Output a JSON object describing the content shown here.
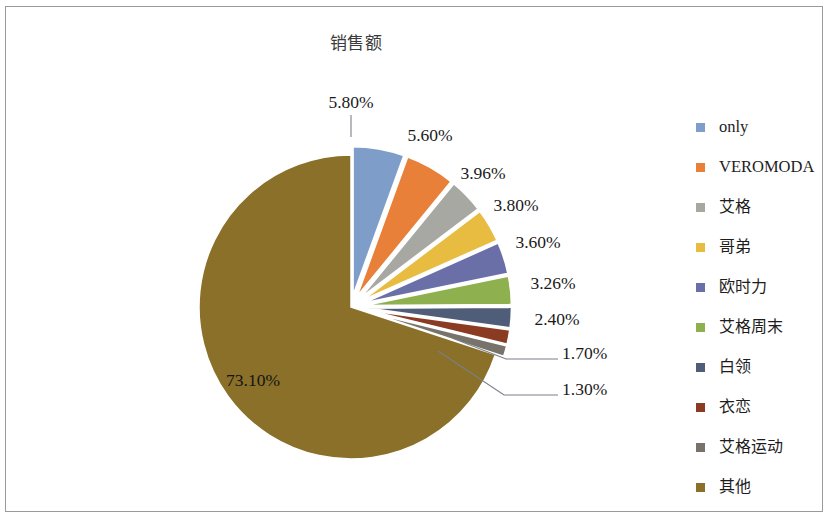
{
  "chart_data": {
    "type": "pie",
    "title": "销售额",
    "xlabel": "",
    "ylabel": "",
    "legend_position": "right",
    "grid": false,
    "categories": [
      "only",
      "VEROMODA",
      "艾格",
      "哥弟",
      "欧时力",
      "艾格周末",
      "白领",
      "衣恋",
      "艾格运动",
      "其他"
    ],
    "values": [
      5.8,
      5.6,
      3.96,
      3.8,
      3.6,
      3.26,
      2.4,
      1.7,
      1.3,
      73.1
    ],
    "data_labels": [
      "5.80%",
      "5.60%",
      "3.96%",
      "3.80%",
      "3.60%",
      "3.26%",
      "2.40%",
      "1.70%",
      "1.30%",
      "73.10%"
    ],
    "unit": "%",
    "colors": [
      "#7f9dc9",
      "#e8803a",
      "#a8a8a3",
      "#e8bc41",
      "#6a6fa8",
      "#8fb04f",
      "#4f5d78",
      "#8c3b23",
      "#77736a",
      "#8a7028"
    ]
  },
  "legend": {
    "items": [
      {
        "label": "only",
        "color": "#7f9dc9",
        "cjk": false
      },
      {
        "label": "VEROMODA",
        "color": "#e8803a",
        "cjk": false
      },
      {
        "label": "艾格",
        "color": "#a8a8a3",
        "cjk": true
      },
      {
        "label": "哥弟",
        "color": "#e8bc41",
        "cjk": true
      },
      {
        "label": "欧时力",
        "color": "#6a6fa8",
        "cjk": true
      },
      {
        "label": "艾格周末",
        "color": "#8fb04f",
        "cjk": true
      },
      {
        "label": "白领",
        "color": "#4f5d78",
        "cjk": true
      },
      {
        "label": "衣恋",
        "color": "#8c3b23",
        "cjk": true
      },
      {
        "label": "艾格运动",
        "color": "#77736a",
        "cjk": true
      },
      {
        "label": "其他",
        "color": "#8a7028",
        "cjk": true
      }
    ]
  }
}
